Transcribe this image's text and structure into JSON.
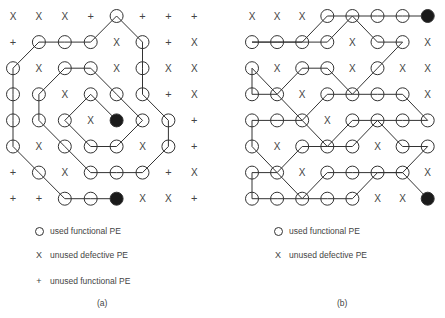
{
  "panels": [
    {
      "id": "a",
      "caption": "(a)",
      "grid": [
        [
          "x",
          "x",
          "x",
          "+",
          "o",
          "+",
          "+",
          "+"
        ],
        [
          "+",
          "o",
          "o",
          "o",
          "x",
          "o",
          "+",
          "x"
        ],
        [
          "o",
          "x",
          "o",
          "o",
          "x",
          "o",
          "x",
          "x"
        ],
        [
          "o",
          "o",
          "x",
          "o",
          "o",
          "o",
          "+",
          "x"
        ],
        [
          "o",
          "o",
          "o",
          "x",
          "f",
          "o",
          "o",
          "+"
        ],
        [
          "o",
          "x",
          "o",
          "o",
          "o",
          "x",
          "o",
          "+"
        ],
        [
          "+",
          "o",
          "x",
          "o",
          "o",
          "o",
          "+",
          "x"
        ],
        [
          "+",
          "+",
          "o",
          "o",
          "f",
          "x",
          "x",
          "+"
        ]
      ],
      "path": [
        [
          [
            7,
            4
          ],
          [
            7,
            3
          ],
          [
            7,
            2
          ],
          [
            6,
            1
          ],
          [
            5,
            0
          ],
          [
            4,
            0
          ],
          [
            3,
            0
          ],
          [
            2,
            0
          ],
          [
            1,
            1
          ],
          [
            1,
            2
          ],
          [
            1,
            3
          ],
          [
            0,
            4
          ],
          [
            1,
            5
          ],
          [
            2,
            5
          ],
          [
            3,
            5
          ],
          [
            4,
            6
          ],
          [
            5,
            6
          ],
          [
            6,
            5
          ],
          [
            6,
            4
          ],
          [
            6,
            3
          ],
          [
            5,
            2
          ],
          [
            4,
            1
          ],
          [
            3,
            1
          ],
          [
            2,
            2
          ],
          [
            2,
            3
          ],
          [
            3,
            4
          ],
          [
            4,
            5
          ],
          [
            5,
            4
          ],
          [
            5,
            3
          ],
          [
            4,
            2
          ],
          [
            3,
            3
          ],
          [
            4,
            4
          ]
        ]
      ],
      "legend": [
        {
          "symbol": "circle",
          "label": "used functional PE"
        },
        {
          "symbol": "x",
          "label": "unused defective PE"
        },
        {
          "symbol": "+",
          "label": "unused functional PE"
        }
      ]
    },
    {
      "id": "b",
      "caption": "(b)",
      "grid": [
        [
          "x",
          "x",
          "x",
          "o",
          "o",
          "o",
          "o",
          "f"
        ],
        [
          "o",
          "o",
          "o",
          "o",
          "x",
          "o",
          "o",
          "x"
        ],
        [
          "o",
          "x",
          "o",
          "o",
          "x",
          "o",
          "x",
          "x"
        ],
        [
          "o",
          "o",
          "x",
          "o",
          "o",
          "o",
          "o",
          "x"
        ],
        [
          "o",
          "o",
          "o",
          "x",
          "o",
          "o",
          "o",
          "o"
        ],
        [
          "o",
          "x",
          "o",
          "o",
          "o",
          "x",
          "o",
          "o"
        ],
        [
          "o",
          "o",
          "x",
          "o",
          "o",
          "o",
          "o",
          "x"
        ],
        [
          "o",
          "o",
          "o",
          "o",
          "o",
          "x",
          "x",
          "f"
        ]
      ],
      "path": [
        [
          [
            0,
            7
          ],
          [
            0,
            6
          ],
          [
            0,
            5
          ],
          [
            0,
            4
          ],
          [
            0,
            3
          ],
          [
            1,
            2
          ],
          [
            1,
            1
          ],
          [
            1,
            0
          ]
        ],
        [
          [
            1,
            0
          ],
          [
            1,
            1
          ],
          [
            1,
            2
          ],
          [
            1,
            3
          ],
          [
            0,
            4
          ],
          [
            1,
            5
          ],
          [
            1,
            6
          ],
          [
            2,
            5
          ],
          [
            3,
            4
          ],
          [
            2,
            3
          ],
          [
            2,
            2
          ],
          [
            3,
            1
          ],
          [
            2,
            0
          ],
          [
            3,
            0
          ],
          [
            3,
            1
          ],
          [
            4,
            2
          ],
          [
            3,
            3
          ],
          [
            3,
            4
          ],
          [
            3,
            5
          ],
          [
            3,
            6
          ],
          [
            4,
            7
          ],
          [
            4,
            6
          ],
          [
            4,
            5
          ],
          [
            4,
            4
          ],
          [
            5,
            3
          ],
          [
            4,
            2
          ],
          [
            4,
            1
          ],
          [
            4,
            0
          ],
          [
            5,
            0
          ],
          [
            6,
            1
          ],
          [
            5,
            2
          ],
          [
            5,
            3
          ],
          [
            5,
            4
          ],
          [
            4,
            5
          ],
          [
            5,
            6
          ],
          [
            5,
            7
          ],
          [
            6,
            6
          ],
          [
            6,
            5
          ],
          [
            6,
            4
          ],
          [
            6,
            3
          ],
          [
            7,
            2
          ],
          [
            6,
            1
          ],
          [
            6,
            0
          ],
          [
            7,
            0
          ],
          [
            7,
            1
          ],
          [
            7,
            2
          ],
          [
            7,
            3
          ],
          [
            7,
            4
          ],
          [
            6,
            5
          ],
          [
            6,
            6
          ],
          [
            7,
            7
          ]
        ]
      ],
      "legend": [
        {
          "symbol": "circle",
          "label": "used functional PE"
        },
        {
          "symbol": "x",
          "label": "unused defective PE"
        }
      ]
    }
  ],
  "colors": {
    "stroke": "#333333",
    "fill_terminal": "#1a1a1a",
    "text": "#444444"
  }
}
